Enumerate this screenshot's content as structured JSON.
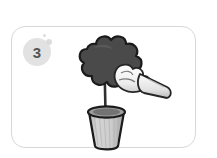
{
  "canvas": {
    "width": 217,
    "height": 158,
    "background": "#ffffff"
  },
  "panel": {
    "name": "step-card",
    "border_color": "#d8d8d8",
    "background": "#ffffff",
    "corner_radius_px": 14
  },
  "badge": {
    "step_number": "3",
    "fill": "#e2e2e2",
    "text_color": "#555555"
  },
  "decor_dots": [
    {
      "id": "dot-small",
      "color": "#dcdcdc",
      "size_px": 3
    },
    {
      "id": "dot-large",
      "color": "#dcdcdc",
      "size_px": 6
    }
  ],
  "illustration": {
    "name": "hand-picking-flower-in-pot",
    "description": "Grayscale line drawing: a gloved hand reaches from the right toward a dark lobed flower head on a thin stem planted in a tapered pot.",
    "parts": [
      {
        "name": "flower-head",
        "fill": "#4a4a4a",
        "outline": "#1e1e1e"
      },
      {
        "name": "flower-stem",
        "fill": "#3a3a3a"
      },
      {
        "name": "flower-pot",
        "fill": "#c9c9c9",
        "outline": "#1e1e1e"
      },
      {
        "name": "pot-rim",
        "fill": "#9d9d9d",
        "outline": "#1e1e1e"
      },
      {
        "name": "gloved-hand",
        "fill": "#f2f2f2",
        "outline": "#2a2a2a"
      },
      {
        "name": "sleeve-cuff",
        "fill": "#e8e8e8",
        "outline": "#2a2a2a"
      }
    ]
  }
}
